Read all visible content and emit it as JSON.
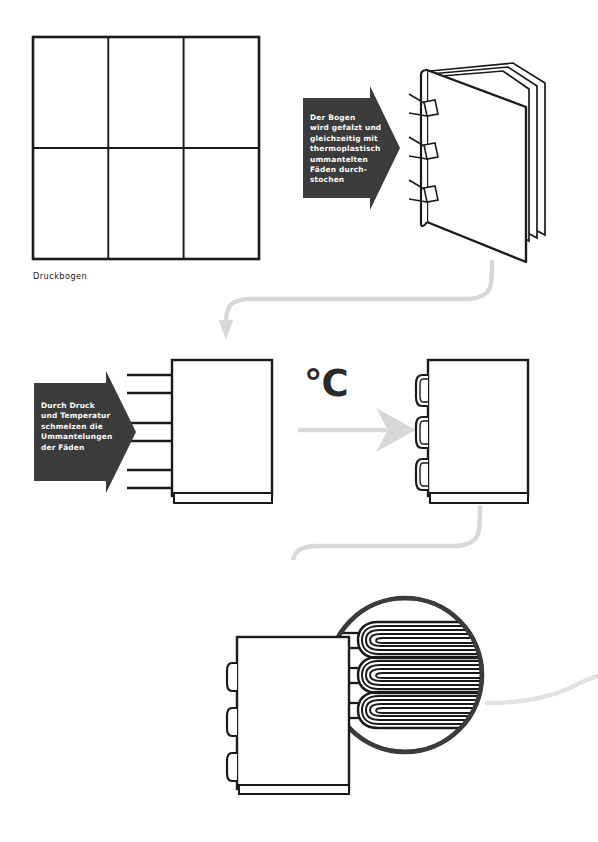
{
  "page": {
    "background_color": "#ffffff",
    "width": 598,
    "height": 842
  },
  "colors": {
    "ink": "#1a1a1a",
    "arrow_block_fill": "#3b3b3b",
    "arrow_block_text": "#ffffff",
    "connector_gray": "#d8d8d8",
    "paper_fill": "#ffffff",
    "loop_dark": "#2b2b2b",
    "magnifier_ring": "#3b3b3b"
  },
  "steps": [
    {
      "id": "step-1",
      "caption": "Druckbogen",
      "artwork": "print-sheet-grid",
      "grid": {
        "columns": 3,
        "rows": 2
      }
    },
    {
      "id": "step-2",
      "arrow_label": "Der Bogen\nwird gefalzt und\ngleichzeitig mit\nthermoplastisch\nummantelten\nFäden durch-\nstochen",
      "artwork": "folded-signature-with-threads",
      "thread_stitch_count": 3
    },
    {
      "id": "step-3",
      "arrow_label": "Durch Druck\nund Temperatur\nschmelzen die\nUmmantelungen\nder Fäden",
      "artwork": "signature-with-loose-threads",
      "thread_stub_count": 6
    },
    {
      "id": "step-4",
      "symbol": "°C",
      "symbol_name": "degrees-celsius-symbol",
      "artwork": "signature-with-melted-loops",
      "melted_loop_count": 3
    },
    {
      "id": "step-5",
      "arrow_label": "Die fadenge-\nsiegelten Bogen\nwerden zusam-\nmengetragen",
      "artwork": "collated-signature-stack",
      "stack_count": 4,
      "magnifier": {
        "name": "thread-loop-magnifier",
        "loop_count": 3,
        "strokes_per_loop": 6
      }
    }
  ],
  "connectors": [
    {
      "name": "connector-step2-to-step3",
      "direction": "right-to-left-down"
    },
    {
      "name": "connector-step4-to-step5",
      "direction": "right-to-left-down"
    },
    {
      "name": "connector-heat-arrow",
      "direction": "left-to-right"
    },
    {
      "name": "connector-exit-right",
      "direction": "to-right-edge"
    }
  ]
}
